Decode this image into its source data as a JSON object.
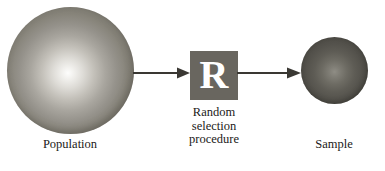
{
  "figure": {
    "background_color": "#ffffff"
  },
  "population": {
    "label": "Population",
    "shape": "sphere",
    "fill_description": "light grey sphere with bright centre highlight",
    "highlight_color": "#fdfdfc",
    "edge_color": "#706d64",
    "diameter_px": 127
  },
  "procedure": {
    "letter": "R",
    "label": "Random\nselection\nprocedure",
    "box_color": "#69665f",
    "letter_color": "#ffffff",
    "box_size_px": 48
  },
  "sample": {
    "label": "Sample",
    "shape": "sphere",
    "fill_description": "dark grey sphere with faint centre highlight",
    "highlight_color": "#8f8d85",
    "edge_color": "#454340",
    "diameter_px": 67
  },
  "arrows": [
    {
      "name": "population-to-procedure",
      "direction": "right",
      "color": "#3a3833"
    },
    {
      "name": "procedure-to-sample",
      "direction": "right",
      "color": "#3a3833"
    }
  ],
  "caption": {
    "text": " "
  }
}
